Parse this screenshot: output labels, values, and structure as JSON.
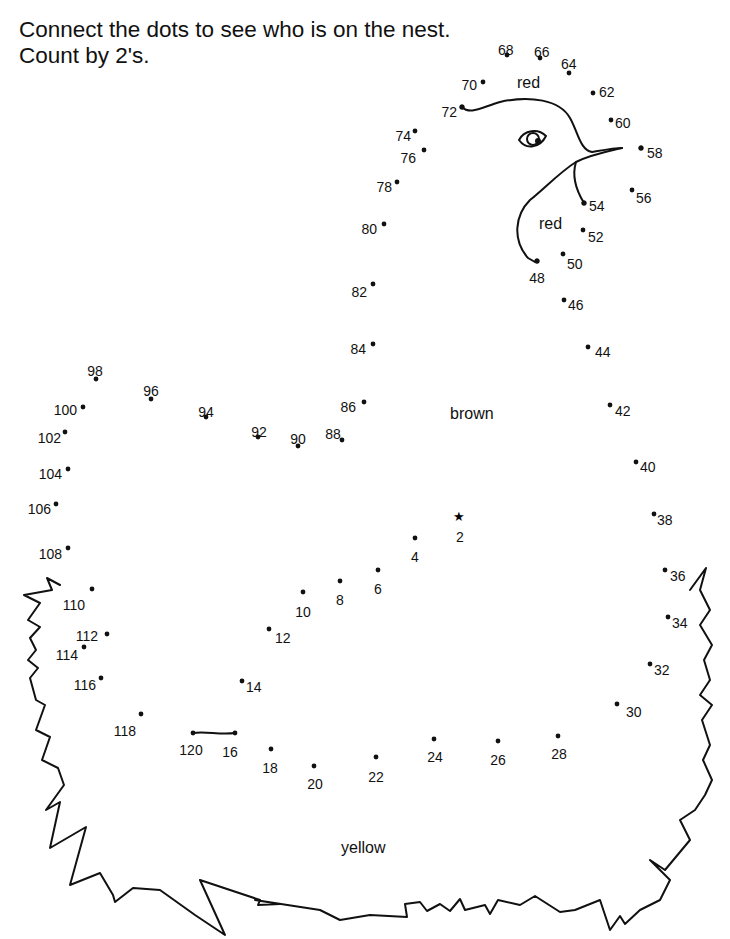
{
  "worksheet": {
    "instruction_line_1": "Connect the dots to see who is on the nest.",
    "instruction_line_2": "Count by 2's.",
    "start_marker": "star-icon",
    "dots": [
      "2",
      "4",
      "6",
      "8",
      "10",
      "12",
      "14",
      "16",
      "18",
      "20",
      "22",
      "24",
      "26",
      "28",
      "30",
      "32",
      "34",
      "36",
      "38",
      "40",
      "42",
      "44",
      "46",
      "48",
      "50",
      "52",
      "54",
      "56",
      "58",
      "60",
      "62",
      "64",
      "66",
      "68",
      "70",
      "72",
      "74",
      "76",
      "78",
      "80",
      "82",
      "84",
      "86",
      "88",
      "90",
      "92",
      "94",
      "96",
      "98",
      "100",
      "102",
      "104",
      "106",
      "108",
      "110",
      "112",
      "114",
      "116",
      "118",
      "120"
    ],
    "color_labels": {
      "comb": "red",
      "wattle": "red",
      "body": "brown",
      "nest": "yellow"
    }
  }
}
